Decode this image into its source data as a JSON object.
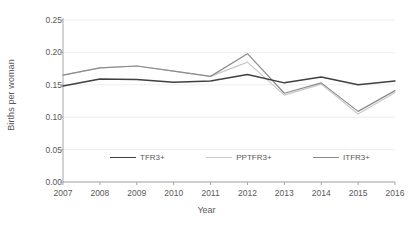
{
  "chart_data": {
    "type": "line",
    "title": "",
    "xlabel": "Year",
    "ylabel": "Births per woman",
    "categories": [
      "2007",
      "2008",
      "2009",
      "2010",
      "2011",
      "2012",
      "2013",
      "2014",
      "2015",
      "2016"
    ],
    "x": [
      2007,
      2008,
      2009,
      2010,
      2011,
      2012,
      2013,
      2014,
      2015,
      2016
    ],
    "ylim": [
      0.0,
      0.25
    ],
    "yticks": [
      0.0,
      0.05,
      0.1,
      0.15,
      0.2,
      0.25
    ],
    "ytick_labels": [
      "0.00",
      "0.05",
      "0.10",
      "0.15",
      "0.20",
      "0.25"
    ],
    "grid": "horizontal",
    "legend_position": "inside-bottom-center",
    "series": [
      {
        "name": "TFR3+",
        "color": "#404040",
        "values": [
          0.148,
          0.159,
          0.158,
          0.154,
          0.156,
          0.166,
          0.153,
          0.162,
          0.15,
          0.156
        ]
      },
      {
        "name": "PPTFR3+",
        "color": "#c9c9c9",
        "values": [
          0.165,
          0.176,
          0.179,
          0.171,
          0.163,
          0.185,
          0.134,
          0.151,
          0.105,
          0.138
        ]
      },
      {
        "name": "ITFR3+",
        "color": "#8c8c8c",
        "values": [
          0.165,
          0.176,
          0.179,
          0.171,
          0.163,
          0.198,
          0.137,
          0.153,
          0.109,
          0.141
        ]
      }
    ]
  },
  "legend": {
    "items": [
      {
        "label": "TFR3+"
      },
      {
        "label": "PPTFR3+"
      },
      {
        "label": "ITFR3+"
      }
    ]
  },
  "axes": {
    "y_title": "Births per woman",
    "x_title": "Year"
  }
}
